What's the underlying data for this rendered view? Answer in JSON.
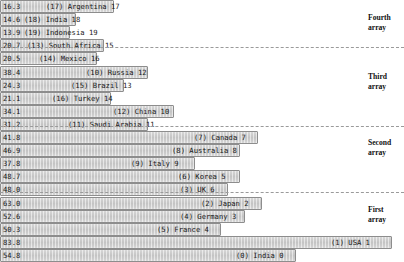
{
  "chart_data": {
    "type": "bar",
    "orientation": "horizontal",
    "title": "",
    "xlabel": "",
    "ylabel": "",
    "grid": false,
    "legend": "none",
    "xlim": [
      0,
      100
    ],
    "value_axis_note": "Left-aligned numeric value printed inside each bar; bar length proportional to value.",
    "categories": [
      "Argentina 17",
      "India 18",
      "Indonesia 19",
      "South Africa 15",
      "Mexico 16",
      "Russia 12",
      "Brazil 13",
      "Turkey 14",
      "China 10",
      "Saudi Arabia 11",
      "Canada 7",
      "Australia 8",
      "Italy 9",
      "Korea 5",
      "UK 6",
      "Japan 2",
      "Germany 3",
      "France 4",
      "USA 1",
      "India 0"
    ],
    "values": [
      16.3,
      14.6,
      13.9,
      20.7,
      20.5,
      38.4,
      24.3,
      21.1,
      34.1,
      31.2,
      41.8,
      46.9,
      37.8,
      48.7,
      48.0,
      63.0,
      52.6,
      50.3,
      83.8,
      54.8
    ],
    "bars": [
      {
        "value": 16.3,
        "value_text": "16.3",
        "label": "(17) Argentina 17",
        "rank": 17,
        "country": "Argentina",
        "bar_px": 114,
        "label_x": 46
      },
      {
        "value": 14.6,
        "value_text": "14.6",
        "label": "(18) India 18",
        "rank": 18,
        "country": "India",
        "bar_px": 76,
        "label_x": 24
      },
      {
        "value": 13.9,
        "value_text": "13.9",
        "label": "(19) Indonesia 19",
        "rank": 19,
        "country": "Indonesia",
        "bar_px": 70,
        "label_x": 24
      },
      {
        "value": 20.7,
        "value_text": "20.7",
        "label": "(13) South Africa 15",
        "rank": 13,
        "country": "South Africa",
        "bar_px": 104,
        "label_x": 27
      },
      {
        "value": 20.5,
        "value_text": "20.5",
        "label": "(14) Mexico 16",
        "rank": 14,
        "country": "Mexico",
        "bar_px": 97,
        "label_x": 39
      },
      {
        "value": 38.4,
        "value_text": "38.4",
        "label": "(10) Russia 12",
        "rank": 10,
        "country": "Russia",
        "bar_px": 148,
        "label_x": 86
      },
      {
        "value": 24.3,
        "value_text": "24.3",
        "label": "(15) Brazil 13",
        "rank": 15,
        "country": "Brazil",
        "bar_px": 124,
        "label_x": 71
      },
      {
        "value": 21.1,
        "value_text": "21.1",
        "label": "(16) Turkey 14",
        "rank": 16,
        "country": "Turkey",
        "bar_px": 111,
        "label_x": 52
      },
      {
        "value": 34.1,
        "value_text": "34.1",
        "label": "(12) China 10",
        "rank": 12,
        "country": "China",
        "bar_px": 174,
        "label_x": 113
      },
      {
        "value": 31.2,
        "value_text": "31.2",
        "label": "(11) Saudi Arabia 11",
        "rank": 11,
        "country": "Saudi Arabia",
        "bar_px": 148,
        "label_x": 68
      },
      {
        "value": 41.8,
        "value_text": "41.8",
        "label": "(7) Canada 7",
        "rank": 7,
        "country": "Canada",
        "bar_px": 258,
        "label_x": 194
      },
      {
        "value": 46.9,
        "value_text": "46.9",
        "label": "(8) Australia 8",
        "rank": 8,
        "country": "Australia",
        "bar_px": 240,
        "label_x": 172
      },
      {
        "value": 37.8,
        "value_text": "37.8",
        "label": "(9) Italy 9",
        "rank": 9,
        "country": "Italy",
        "bar_px": 195,
        "label_x": 131
      },
      {
        "value": 48.7,
        "value_text": "48.7",
        "label": "(6) Korea 5",
        "rank": 6,
        "country": "Korea",
        "bar_px": 240,
        "label_x": 178
      },
      {
        "value": 48.0,
        "value_text": "48.0",
        "label": "(3) UK 6",
        "rank": 3,
        "country": "UK",
        "bar_px": 228,
        "label_x": 180
      },
      {
        "value": 63.0,
        "value_text": "63.0",
        "label": "(2) Japan 2",
        "rank": 2,
        "country": "Japan",
        "bar_px": 262,
        "label_x": 201
      },
      {
        "value": 52.6,
        "value_text": "52.6",
        "label": "(4) Germany 3",
        "rank": 4,
        "country": "Germany",
        "bar_px": 245,
        "label_x": 180
      },
      {
        "value": 50.3,
        "value_text": "50.3",
        "label": "(5) France 4",
        "rank": 5,
        "country": "France",
        "bar_px": 221,
        "label_x": 157
      },
      {
        "value": 83.8,
        "value_text": "83.8",
        "label": "(1) USA 1",
        "rank": 1,
        "country": "USA",
        "bar_px": 392,
        "label_x": 331
      },
      {
        "value": 54.8,
        "value_text": "54.8",
        "label": "(0) India 0",
        "rank": 0,
        "country": "India",
        "bar_px": 296,
        "label_x": 236
      }
    ],
    "group_dividers": [
      {
        "after_index": 3,
        "y": 47
      },
      {
        "after_index": 9,
        "y": 126
      },
      {
        "after_index": 14,
        "y": 192
      }
    ],
    "groups": [
      {
        "name": "Fourth array",
        "line1": "Fourth",
        "line2": "array",
        "y": 13
      },
      {
        "name": "Third array",
        "line1": "Third",
        "line2": "array",
        "y": 72
      },
      {
        "name": "Second array",
        "line1": "Second",
        "line2": "array",
        "y": 138
      },
      {
        "name": "First array",
        "line1": "First",
        "line2": "array",
        "y": 205
      }
    ],
    "colors": {
      "bar_fill": "#c9c9c9",
      "bar_border": "#8d8d8d",
      "divider": "#9a9a9a",
      "text": "#1a1a1a",
      "background": "#ffffff"
    }
  }
}
